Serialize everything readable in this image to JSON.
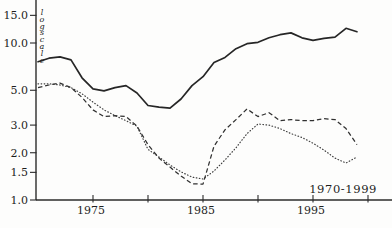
{
  "figure": {
    "y_axis_note": "log scale",
    "range_label": "1970-1999",
    "ink_color": "#262626"
  },
  "chart_data": {
    "type": "line",
    "title": "",
    "xlabel": "",
    "ylabel": "log scale",
    "annotation": "1970-1999",
    "scale": "log",
    "grid": false,
    "legend": "none",
    "xlim": [
      1970,
      2000.5
    ],
    "ylim": [
      1.0,
      16.5
    ],
    "y_ticks": [
      15.0,
      10.0,
      5.0,
      3.0,
      2.0,
      1.5,
      1.0
    ],
    "x_ticks": [
      1975,
      1980,
      1985,
      1990,
      1995,
      2000
    ],
    "x_ticks_labeled": [
      1975,
      1985,
      1995
    ],
    "x": [
      1970,
      1971,
      1972,
      1973,
      1974,
      1975,
      1976,
      1977,
      1978,
      1979,
      1980,
      1981,
      1982,
      1983,
      1984,
      1985,
      1986,
      1987,
      1988,
      1989,
      1990,
      1991,
      1992,
      1993,
      1994,
      1995,
      1996,
      1997,
      1998,
      1999
    ],
    "series": [
      {
        "name": "solid",
        "style": "solid",
        "values": [
          7.6,
          8.0,
          8.15,
          7.8,
          6.0,
          5.1,
          4.95,
          5.2,
          5.35,
          4.8,
          4.0,
          3.9,
          3.85,
          4.4,
          5.35,
          6.1,
          7.5,
          8.1,
          9.2,
          9.9,
          10.1,
          10.8,
          11.3,
          11.6,
          10.8,
          10.4,
          10.7,
          10.9,
          12.4,
          11.8
        ]
      },
      {
        "name": "dashed",
        "style": "dashed",
        "values": [
          5.2,
          5.4,
          5.55,
          5.2,
          4.5,
          3.75,
          3.4,
          3.45,
          3.4,
          2.95,
          2.25,
          1.85,
          1.62,
          1.42,
          1.27,
          1.26,
          2.2,
          2.8,
          3.25,
          3.8,
          3.4,
          3.6,
          3.2,
          3.25,
          3.2,
          3.2,
          3.3,
          3.25,
          2.85,
          2.25
        ]
      },
      {
        "name": "dotted",
        "style": "dotted",
        "values": [
          5.5,
          5.5,
          5.4,
          5.2,
          4.75,
          4.2,
          3.75,
          3.45,
          3.2,
          2.95,
          2.1,
          1.88,
          1.67,
          1.51,
          1.4,
          1.36,
          1.53,
          1.8,
          2.15,
          2.65,
          3.05,
          3.0,
          2.85,
          2.65,
          2.5,
          2.3,
          2.08,
          1.85,
          1.72,
          1.88
        ]
      }
    ]
  }
}
